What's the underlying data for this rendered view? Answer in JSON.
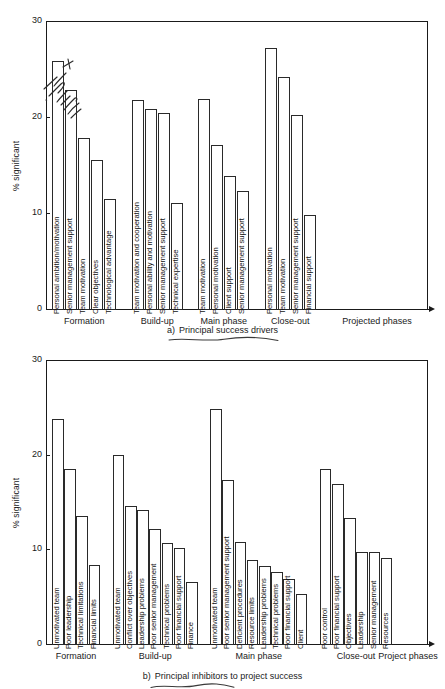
{
  "figure": {
    "yaxis_title": "% significant",
    "y_ticks": [
      "30",
      "20",
      "10",
      "0"
    ],
    "y_tick_values": [
      30,
      20,
      10,
      0
    ],
    "caption_a_index": "a)",
    "caption_a_text": "Principal success drivers",
    "caption_b_index": "b)",
    "caption_b_text": "Principal inhibitors to project success",
    "annotation_handwritten": "handwritten-cjk-scrawl"
  },
  "chart_data": [
    {
      "type": "bar",
      "title": "a)  Principal success drivers",
      "xlabel": "Projected phases",
      "ylabel": "% significant",
      "ylim": [
        0,
        30
      ],
      "yticks": [
        0,
        10,
        20,
        30
      ],
      "grid": false,
      "legend": "none",
      "groups": [
        {
          "name": "Formation",
          "categories": [
            "Personal ambition/motivation",
            "Senior management support",
            "Team motivation",
            "Clear objectives",
            "Technological advantage"
          ],
          "values": [
            25.8,
            22.8,
            17.8,
            15.5,
            11.5
          ]
        },
        {
          "name": "Build-up",
          "categories": [
            "Team motivation and cooperation",
            "Personal ability and motivation",
            "Senior management support",
            "Technical expertise"
          ],
          "values": [
            21.8,
            20.8,
            20.4,
            11.0
          ]
        },
        {
          "name": "Main phase",
          "categories": [
            "Team motivation",
            "Personal motivation",
            "Client support",
            "Senior management support"
          ],
          "values": [
            21.9,
            17.1,
            13.9,
            12.3
          ]
        },
        {
          "name": "Close-out",
          "categories": [
            "Personal motivation",
            "Team motivation",
            "Senior management support",
            "Financial support"
          ],
          "values": [
            27.2,
            24.2,
            20.2,
            9.8
          ]
        },
        {
          "name": "Projected phases",
          "categories": [],
          "values": []
        }
      ]
    },
    {
      "type": "bar",
      "title": "b)  Principal inhibitors to project success",
      "xlabel": "Project phases",
      "ylabel": "% significant",
      "ylim": [
        0,
        30
      ],
      "yticks": [
        0,
        10,
        20,
        30
      ],
      "grid": false,
      "legend": "none",
      "groups": [
        {
          "name": "Formation",
          "categories": [
            "Unmotivated team",
            "Poor leadership",
            "Technical limitations",
            "Financial limits"
          ],
          "values": [
            23.8,
            18.5,
            13.5,
            8.3
          ]
        },
        {
          "name": "Build-up",
          "categories": [
            "Unmotivated team",
            "Conflict over objectives",
            "Leadership problems",
            "Poor senior management",
            "Technical problems",
            "Poor financial support",
            "Finance"
          ],
          "values": [
            20.0,
            14.6,
            14.2,
            12.2,
            10.7,
            10.1,
            6.5
          ]
        },
        {
          "name": "Main phase",
          "categories": [
            "Unmotivated team",
            "Poor senior management support",
            "Deficient procedures",
            "Resource limits",
            "Leadership problems",
            "Technical problems",
            "Poor financial support",
            "Client"
          ],
          "values": [
            24.8,
            17.3,
            10.8,
            8.9,
            8.2,
            7.6,
            6.9,
            5.3
          ]
        },
        {
          "name": "Close-out",
          "categories": [
            "Poor control",
            "Poor financial support",
            "Objectives",
            "Leadership",
            "Senior management",
            "Resources"
          ],
          "values": [
            18.5,
            16.9,
            13.3,
            9.7,
            9.7,
            9.1
          ]
        },
        {
          "name": "Project phases",
          "categories": [],
          "values": []
        }
      ]
    }
  ]
}
